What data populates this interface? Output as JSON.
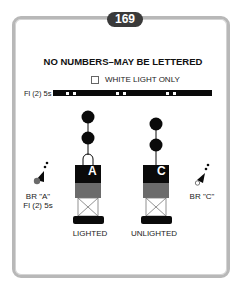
{
  "page_number": "169",
  "heading": "NO NUMBERS–MAY BE LETTERED",
  "legend": {
    "icon": "white-square-icon",
    "label": "WHITE LIGHT ONLY"
  },
  "light_characteristic": {
    "label": "Fl (2) 5s",
    "flash_groups": 3,
    "flashes_per_group": 2
  },
  "buoys": [
    {
      "id": "lighted",
      "letter": "A",
      "label": "LIGHTED",
      "topmark": "two black spheres",
      "bands": [
        "black",
        "red"
      ],
      "has_light": true
    },
    {
      "id": "unlighted",
      "letter": "C",
      "label": "UNLIGHTED",
      "topmark": "two black spheres",
      "bands": [
        "black",
        "red"
      ],
      "has_light": false
    }
  ],
  "chart_symbols": [
    {
      "id": "br-a",
      "line1": "BR \"A\"",
      "line2": "Fl (2) 5s"
    },
    {
      "id": "br-c",
      "line1": "BR \"C\"",
      "line2": ""
    }
  ],
  "colors": {
    "black": "#0a0a0a",
    "red_band": "#6b6b6b",
    "frame": "#b8b8b8",
    "badge": "#3a3a3a"
  }
}
